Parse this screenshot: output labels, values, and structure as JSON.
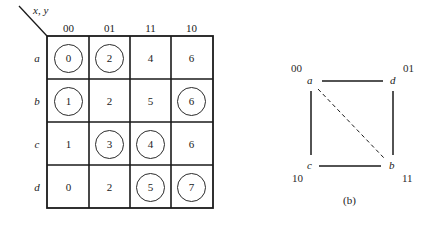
{
  "kmap": {
    "corner_label": "x, y",
    "columns": [
      "00",
      "01",
      "11",
      "10"
    ],
    "rows": [
      {
        "label": "a",
        "cells": [
          {
            "value": "0",
            "circled": true
          },
          {
            "value": "2",
            "circled": true
          },
          {
            "value": "4",
            "circled": false
          },
          {
            "value": "6",
            "circled": false
          }
        ]
      },
      {
        "label": "b",
        "cells": [
          {
            "value": "1",
            "circled": true
          },
          {
            "value": "2",
            "circled": false
          },
          {
            "value": "5",
            "circled": false
          },
          {
            "value": "6",
            "circled": true
          }
        ]
      },
      {
        "label": "c",
        "cells": [
          {
            "value": "1",
            "circled": false
          },
          {
            "value": "3",
            "circled": true
          },
          {
            "value": "4",
            "circled": true
          },
          {
            "value": "6",
            "circled": false
          }
        ]
      },
      {
        "label": "d",
        "cells": [
          {
            "value": "0",
            "circled": false
          },
          {
            "value": "2",
            "circled": false
          },
          {
            "value": "5",
            "circled": true
          },
          {
            "value": "7",
            "circled": true
          }
        ]
      }
    ]
  },
  "graph": {
    "nodes": {
      "a": {
        "label": "a",
        "code": "00"
      },
      "d": {
        "label": "d",
        "code": "01"
      },
      "c": {
        "label": "c",
        "code": "10"
      },
      "b": {
        "label": "b",
        "code": "11"
      }
    },
    "edges": [
      {
        "from": "a",
        "to": "d",
        "style": "solid"
      },
      {
        "from": "a",
        "to": "c",
        "style": "solid"
      },
      {
        "from": "d",
        "to": "b",
        "style": "solid"
      },
      {
        "from": "c",
        "to": "b",
        "style": "solid"
      },
      {
        "from": "a",
        "to": "b",
        "style": "dashed"
      }
    ],
    "caption": "(b)"
  },
  "colors": {
    "line": "#1a1a1a",
    "background": "#ffffff"
  }
}
